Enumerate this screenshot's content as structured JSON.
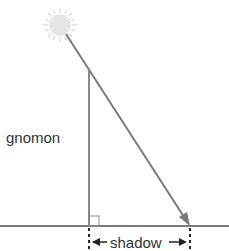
{
  "labels": {
    "gnomon": "gnomon",
    "shadow": "shadow"
  },
  "colors": {
    "line": "#7a7a7a",
    "sun_fill": "#e6e6e6",
    "text": "#333333"
  }
}
